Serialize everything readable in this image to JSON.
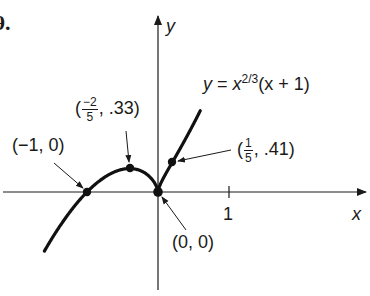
{
  "figure": {
    "problem_number": "9.",
    "axes": {
      "x_label": "x",
      "y_label": "y",
      "x_tick_label": "1"
    },
    "equation": {
      "lhs": "y",
      "eq": "=",
      "base": "x",
      "exponent": "2/3",
      "factor": "(x + 1)"
    },
    "points": [
      {
        "name": "root-left",
        "label": "(−1, 0)",
        "x": -1,
        "y": 0
      },
      {
        "name": "local-max",
        "label_prefix": "(",
        "frac_num": "−2",
        "frac_den": "5",
        "label_suffix": ", .33)",
        "x": -0.4,
        "y": 0.33
      },
      {
        "name": "cusp",
        "label": "(0, 0)",
        "x": 0,
        "y": 0
      },
      {
        "name": "inflection",
        "label_prefix": "(",
        "frac_num": "1",
        "frac_den": "5",
        "label_suffix": ", .41)",
        "x": 0.2,
        "y": 0.41
      }
    ],
    "colors": {
      "ink": "#1a1a1a",
      "background": "#ffffff"
    }
  },
  "chart_data": {
    "type": "line",
    "xlabel": "x",
    "ylabel": "y",
    "x_ticks": [
      1
    ],
    "x_range": [
      -1.6,
      2.9
    ],
    "y_range": [
      -1.3,
      2.7
    ],
    "grid": false,
    "series": [
      {
        "name": "y = x^(2/3)(x + 1)",
        "x": [
          -1.6,
          -1.4,
          -1.2,
          -1.0,
          -0.8,
          -0.6,
          -0.4,
          -0.2,
          0.0,
          0.1,
          0.2,
          0.4,
          0.6,
          0.8,
          1.0
        ],
        "values": [
          -0.82,
          -0.5,
          -0.23,
          0.0,
          0.17,
          0.28,
          0.33,
          0.27,
          0.0,
          0.24,
          0.41,
          0.76,
          1.14,
          1.55,
          2.0
        ]
      }
    ],
    "annotations": [
      {
        "text": "(−1, 0)",
        "x": -1,
        "y": 0
      },
      {
        "text": "(−2/5, .33)",
        "x": -0.4,
        "y": 0.33
      },
      {
        "text": "(0, 0)",
        "x": 0,
        "y": 0
      },
      {
        "text": "(1/5, .41)",
        "x": 0.2,
        "y": 0.41
      }
    ]
  }
}
